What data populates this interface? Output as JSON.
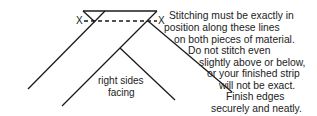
{
  "diagram": {
    "marks": {
      "left_x": "X",
      "right_x": "X"
    },
    "label": {
      "line1": "right sides",
      "line2": "facing"
    },
    "note_lines": [
      "Stitching must be exactly in",
      "position along these lines",
      "on both pieces of material.",
      "Do not stitch even",
      "slightly above or below,",
      "or your finished strip",
      "will not be exact.",
      "Finish edges",
      "securely and neatly."
    ],
    "colors": {
      "line": "#1a1a1a",
      "text": "#222222",
      "background": "#ffffff"
    }
  }
}
